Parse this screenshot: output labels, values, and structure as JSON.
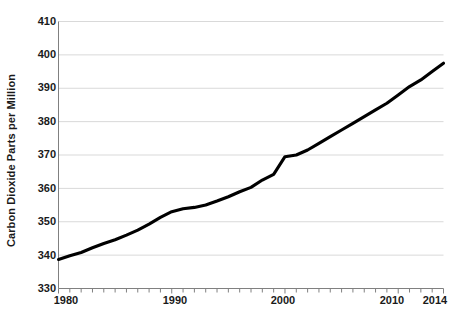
{
  "chart_data": {
    "type": "line",
    "title": "",
    "xlabel": "",
    "ylabel": "Carbon Dioxide Parts per Million",
    "xlim": [
      1980,
      2014
    ],
    "ylim": [
      330,
      410
    ],
    "y_ticks": [
      330,
      340,
      350,
      360,
      370,
      380,
      390,
      400,
      410
    ],
    "x_ticks_labeled": [
      1980,
      1990,
      2000,
      2010,
      2014
    ],
    "x_minor_tick_step": 1,
    "grid": "horizontal",
    "legend": "none",
    "line_color": "#000000",
    "grid_color": "#d9d9d9",
    "axis_color": "#808080",
    "series": [
      {
        "name": "Atmospheric CO2",
        "x": [
          1980,
          1981,
          1982,
          1983,
          1984,
          1985,
          1986,
          1987,
          1988,
          1989,
          1990,
          1991,
          1992,
          1993,
          1994,
          1995,
          1996,
          1997,
          1998,
          1999,
          2000,
          2001,
          2002,
          2003,
          2004,
          2005,
          2006,
          2007,
          2008,
          2009,
          2010,
          2011,
          2012,
          2013,
          2014
        ],
        "values": [
          338.7,
          339.8,
          340.8,
          342.2,
          343.5,
          344.6,
          346.0,
          347.5,
          349.3,
          351.3,
          353.0,
          353.9,
          354.3,
          355.0,
          356.2,
          357.5,
          359.0,
          360.3,
          362.5,
          364.2,
          369.5,
          370.0,
          371.5,
          373.5,
          375.5,
          377.5,
          379.5,
          381.5,
          383.5,
          385.5,
          388.0,
          390.5,
          392.5,
          395.0,
          397.5
        ]
      }
    ]
  },
  "axis": {
    "y_title": "Carbon Dioxide Parts per Million",
    "y_labels": [
      "410",
      "400",
      "390",
      "380",
      "370",
      "360",
      "350",
      "340",
      "330"
    ],
    "x_labels": [
      "1980",
      "1990",
      "2000",
      "2010",
      "2014"
    ]
  }
}
